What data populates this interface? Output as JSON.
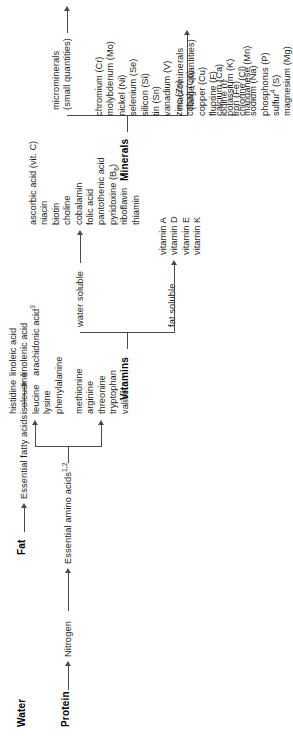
{
  "figure": {
    "orientation": "rotated-90-ccw"
  },
  "groups": {
    "water": {
      "header": "Water"
    },
    "protein": {
      "header": "Protein",
      "level1": "Nitrogen",
      "level2": "Essential amino acids",
      "level2_sup": "1,2",
      "branch_a": [
        "methionine",
        "arginine",
        "threonine",
        "tryptophan",
        "valine"
      ],
      "branch_b": [
        "histidine",
        "isoleucine",
        "leucine",
        "lysine",
        "phenylalanine"
      ]
    },
    "fat": {
      "header": "Fat",
      "level1": "Essential fatty acids",
      "items": [
        "linoleic acid",
        "linolenic acid",
        "arachidonic acid"
      ],
      "items_sup_last": "3"
    },
    "vitamins": {
      "header": "Vitamins",
      "fat_soluble_label": "fat soluble",
      "fat_soluble": [
        "vitamin A",
        "vitamin D",
        "vitamin E",
        "vitamin K"
      ],
      "water_soluble_label": "water soluble",
      "water_soluble": [
        "ascorbic acid (vit. C)",
        "niacin",
        "biotin",
        "choline",
        "cobalamin",
        "folic acid",
        "pantothenic acid",
        "pyridoxine (B",
        "riboflavin",
        "thiamin"
      ],
      "pyridoxine_sub": "6",
      "pyridoxine_tail": ")"
    },
    "minerals": {
      "header": "Minerals",
      "macro_label_line1": "macrominerals",
      "macro_label_line2": "(large quantities)",
      "macrominerals": [
        "calcium (Ca)",
        "potassium (K)",
        "chlorine (Cl)",
        "sodium (Na)",
        "phosphorus (P)",
        "sulfur",
        "magnesium (Mg)"
      ],
      "sulfur_sup": "4",
      "sulfur_tail": " (S)",
      "micro_label_line1": "microminerals",
      "micro_label_line2": "(small quantities)",
      "microminerals": [
        "chromium (Cr)",
        "molybdenum (Mo)",
        "nickel (Ni)",
        "selenium (Se)",
        "silicon (Si)",
        "tin (Sn)",
        "vanadium (V)",
        "zinc (Zn)",
        "cobalt (Co)",
        "copper (Cu)",
        "fluorine (F)",
        "iodine (I)",
        "iron (Fe)",
        "manganese (Mn)"
      ]
    }
  },
  "colors": {
    "text": "#1c1c1c",
    "line": "#4a4a4a",
    "background": "#ffffff"
  }
}
